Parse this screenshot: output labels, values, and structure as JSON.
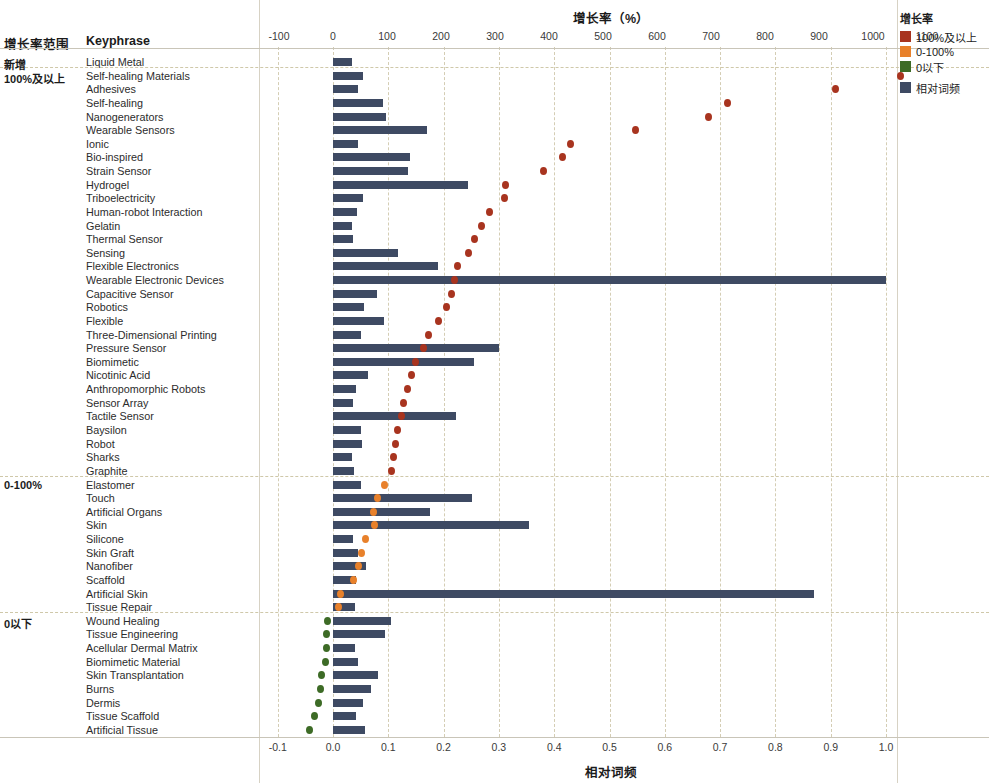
{
  "headers": {
    "group_column": "增长率范围",
    "keyphrase_column": "Keyphrase"
  },
  "top_axis": {
    "title": "增长率（%）",
    "ticks": [
      "-100",
      "0",
      "100",
      "200",
      "300",
      "400",
      "500",
      "600",
      "700",
      "800",
      "900",
      "1000",
      "1100"
    ]
  },
  "bottom_axis": {
    "title": "相对词频",
    "ticks": [
      "-0.1",
      "0.0",
      "0.1",
      "0.2",
      "0.3",
      "0.4",
      "0.5",
      "0.6",
      "0.7",
      "0.8",
      "0.9",
      "1.0"
    ]
  },
  "legend": {
    "title": "增长率",
    "items": [
      {
        "label": "100%及以上",
        "color": "#a8341f"
      },
      {
        "label": "0-100%",
        "color": "#e8812b"
      },
      {
        "label": "0以下",
        "color": "#3d6b26"
      }
    ],
    "bar_item": {
      "label": "相对词频",
      "color": "#3e4a63"
    }
  },
  "chart_data": {
    "type": "bar",
    "title": "增长率（%）",
    "xlabel": "相对词频",
    "ylabel": "Keyphrase",
    "grid": true,
    "legend_position": "top-right",
    "top_axis": {
      "label": "增长率（%）",
      "range": [
        -100,
        1100
      ]
    },
    "bottom_axis": {
      "label": "相对词频",
      "range": [
        -0.1,
        1.0
      ]
    },
    "series": [
      {
        "name": "相对词频",
        "type": "bar",
        "color": "#3e4a63"
      },
      {
        "name": "增长率",
        "type": "scatter",
        "colors": {
          "100%及以上": "#a8341f",
          "0-100%": "#e8812b",
          "0以下": "#3d6b26"
        }
      }
    ],
    "groups": [
      {
        "group": "新增",
        "rows": [
          {
            "keyphrase": "Liquid Metal",
            "freq": 0.035,
            "growth": null
          }
        ]
      },
      {
        "group": "100%及以上",
        "rows": [
          {
            "keyphrase": "Self-healing Materials",
            "freq": 0.055,
            "growth": 1050
          },
          {
            "keyphrase": "Adhesives",
            "freq": 0.046,
            "growth": 930
          },
          {
            "keyphrase": "Self-healing",
            "freq": 0.09,
            "growth": 730
          },
          {
            "keyphrase": "Nanogenerators",
            "freq": 0.095,
            "growth": 695
          },
          {
            "keyphrase": "Wearable Sensors",
            "freq": 0.17,
            "growth": 560
          },
          {
            "keyphrase": "Ionic",
            "freq": 0.045,
            "growth": 440
          },
          {
            "keyphrase": "Bio-inspired",
            "freq": 0.14,
            "growth": 425
          },
          {
            "keyphrase": "Strain Sensor",
            "freq": 0.135,
            "growth": 390
          },
          {
            "keyphrase": "Hydrogel",
            "freq": 0.245,
            "growth": 320
          },
          {
            "keyphrase": "Triboelectricity",
            "freq": 0.054,
            "growth": 318
          },
          {
            "keyphrase": "Human-robot Interaction",
            "freq": 0.043,
            "growth": 290
          },
          {
            "keyphrase": "Gelatin",
            "freq": 0.035,
            "growth": 275
          },
          {
            "keyphrase": "Thermal Sensor",
            "freq": 0.036,
            "growth": 262
          },
          {
            "keyphrase": "Sensing",
            "freq": 0.118,
            "growth": 250
          },
          {
            "keyphrase": "Flexible Electronics",
            "freq": 0.19,
            "growth": 230
          },
          {
            "keyphrase": "Wearable Electronic Devices",
            "freq": 1.0,
            "growth": 225
          },
          {
            "keyphrase": "Capacitive Sensor",
            "freq": 0.08,
            "growth": 220
          },
          {
            "keyphrase": "Robotics",
            "freq": 0.056,
            "growth": 210
          },
          {
            "keyphrase": "Flexible",
            "freq": 0.092,
            "growth": 196
          },
          {
            "keyphrase": "Three-Dimensional Printing",
            "freq": 0.05,
            "growth": 176
          },
          {
            "keyphrase": "Pressure Sensor",
            "freq": 0.3,
            "growth": 168
          },
          {
            "keyphrase": "Biomimetic",
            "freq": 0.255,
            "growth": 152
          },
          {
            "keyphrase": "Nicotinic Acid",
            "freq": 0.064,
            "growth": 146
          },
          {
            "keyphrase": "Anthropomorphic Robots",
            "freq": 0.042,
            "growth": 138
          },
          {
            "keyphrase": "Sensor Array",
            "freq": 0.036,
            "growth": 130
          },
          {
            "keyphrase": "Tactile Sensor",
            "freq": 0.222,
            "growth": 126
          },
          {
            "keyphrase": "Baysilon",
            "freq": 0.05,
            "growth": 120
          },
          {
            "keyphrase": "Robot",
            "freq": 0.052,
            "growth": 116
          },
          {
            "keyphrase": "Sharks",
            "freq": 0.034,
            "growth": 112
          },
          {
            "keyphrase": "Graphite",
            "freq": 0.038,
            "growth": 108
          }
        ]
      },
      {
        "group": "0-100%",
        "rows": [
          {
            "keyphrase": "Elastomer",
            "freq": 0.05,
            "growth": 96
          },
          {
            "keyphrase": "Touch",
            "freq": 0.252,
            "growth": 82
          },
          {
            "keyphrase": "Artificial Organs",
            "freq": 0.175,
            "growth": 75
          },
          {
            "keyphrase": "Skin",
            "freq": 0.355,
            "growth": 76
          },
          {
            "keyphrase": "Silicone",
            "freq": 0.036,
            "growth": 60
          },
          {
            "keyphrase": "Skin Graft",
            "freq": 0.045,
            "growth": 52
          },
          {
            "keyphrase": "Nanofiber",
            "freq": 0.06,
            "growth": 48
          },
          {
            "keyphrase": "Scaffold",
            "freq": 0.042,
            "growth": 38
          },
          {
            "keyphrase": "Artificial Skin",
            "freq": 0.87,
            "growth": 14
          },
          {
            "keyphrase": "Tissue Repair",
            "freq": 0.04,
            "growth": 10
          }
        ]
      },
      {
        "group": "0以下",
        "rows": [
          {
            "keyphrase": "Wound Healing",
            "freq": 0.105,
            "growth": -10
          },
          {
            "keyphrase": "Tissue Engineering",
            "freq": 0.094,
            "growth": -12
          },
          {
            "keyphrase": "Acellular Dermal Matrix",
            "freq": 0.04,
            "growth": -12
          },
          {
            "keyphrase": "Biomimetic Material",
            "freq": 0.045,
            "growth": -14
          },
          {
            "keyphrase": "Skin Transplantation",
            "freq": 0.082,
            "growth": -22
          },
          {
            "keyphrase": "Burns",
            "freq": 0.068,
            "growth": -24
          },
          {
            "keyphrase": "Dermis",
            "freq": 0.055,
            "growth": -26
          },
          {
            "keyphrase": "Tissue Scaffold",
            "freq": 0.042,
            "growth": -34
          },
          {
            "keyphrase": "Artificial Tissue",
            "freq": 0.058,
            "growth": -44
          }
        ]
      }
    ]
  }
}
